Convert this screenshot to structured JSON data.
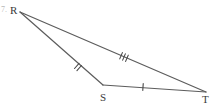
{
  "figure": {
    "kind": "triangle-with-congruence-ticks",
    "stroke_color": "#5c5c5c",
    "tick_color": "#4a4a4a",
    "label_color": "#3a3a3a",
    "background_color": "#ffffff",
    "item_marker": "7.",
    "vertices": [
      {
        "id": "R",
        "label": "R",
        "x": 20,
        "y": 12,
        "label_x": 10,
        "label_y": 5
      },
      {
        "id": "S",
        "label": "S",
        "x": 103,
        "y": 85,
        "label_x": 100,
        "label_y": 92
      },
      {
        "id": "T",
        "label": "T",
        "x": 206,
        "y": 92,
        "label_x": 202,
        "label_y": 94
      }
    ],
    "segments": [
      {
        "id": "RT",
        "name": "segment-rt",
        "from": "R",
        "to": "T",
        "x1": 20,
        "y1": 12,
        "x2": 206,
        "y2": 92,
        "tick_count": 3,
        "tick_center_x": 124,
        "tick_center_y": 57,
        "congruence_group": "c"
      },
      {
        "id": "RS",
        "name": "segment-rs",
        "from": "R",
        "to": "S",
        "x1": 20,
        "y1": 12,
        "x2": 103,
        "y2": 85,
        "tick_count": 2,
        "tick_center_x": 78,
        "tick_center_y": 67,
        "congruence_group": "b"
      },
      {
        "id": "ST",
        "name": "segment-st",
        "from": "S",
        "to": "T",
        "x1": 103,
        "y1": 85,
        "x2": 206,
        "y2": 92,
        "tick_count": 1,
        "tick_center_x": 143,
        "tick_center_y": 87,
        "congruence_group": "a"
      }
    ]
  }
}
